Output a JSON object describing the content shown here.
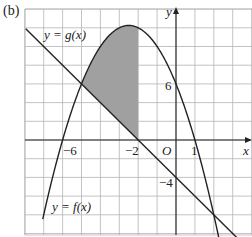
{
  "figure": {
    "subfigure_label": "(b)",
    "curve_labels": {
      "g": "y = g(x)",
      "f": "y = f(x)"
    },
    "axis_labels": {
      "x": "x",
      "y": "y",
      "origin": "O"
    },
    "tick_labels": {
      "x_neg6": "−6",
      "x_neg2": "−2",
      "x_1": "1",
      "y_6": "6",
      "y_neg4": "−4"
    }
  },
  "chart_data": {
    "type": "line",
    "title": "",
    "subfigure": "(b)",
    "xlabel": "x",
    "ylabel": "y",
    "xlim": [
      -8,
      4
    ],
    "ylim": [
      -10,
      14
    ],
    "grid": true,
    "grid_step": {
      "x": 1,
      "y": 2
    },
    "x_ticks_labeled": [
      -6,
      -2,
      1
    ],
    "y_ticks_labeled": [
      6,
      -4
    ],
    "series": [
      {
        "name": "y = f(x)",
        "kind": "parabola",
        "equation_estimate": "f(x) = -(x - 1)(x + 6)",
        "x_intercepts": [
          -6,
          1
        ],
        "y_intercept": 6,
        "vertex_estimate": [
          -2.5,
          12.25
        ]
      },
      {
        "name": "y = g(x)",
        "kind": "straight line",
        "equation_estimate": "g(x) = -2x - 4",
        "x_intercept": -2,
        "y_intercept": -4
      }
    ],
    "intersections": [
      [
        -5,
        6
      ],
      [
        2,
        -8
      ]
    ],
    "shaded_region": {
      "description": "Region bounded above by y = f(x), below by y = g(x), from x = -5 to x = -2 (right edge vertical at x = -2)",
      "x_range": [
        -5,
        -2
      ],
      "fill": "#a0a0a0"
    }
  },
  "colors": {
    "grid": "#b4b4b4",
    "curve": "#222222",
    "shade": "#a0a0a0",
    "background": "#ffffff"
  }
}
